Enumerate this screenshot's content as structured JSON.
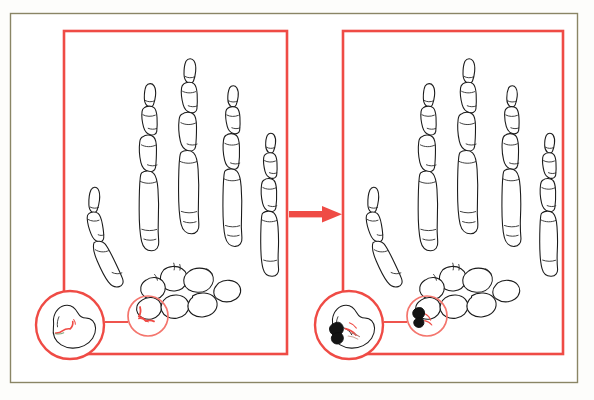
{
  "figure": {
    "title": "Carpal bone fracture before and after surgical fixation",
    "background_color": "#fdfdfb",
    "page_color": "#ffffff"
  },
  "outer_frame": {
    "name": "page-frame",
    "color": "#8a8565",
    "x": 10,
    "y": 13,
    "width": 568,
    "height": 370
  },
  "accent": {
    "red": "#ef4b45",
    "red_light": "#f4756d",
    "bone_outline": "#1b1b1b",
    "hardware_dark": "#141414"
  },
  "panels": [
    {
      "id": "panel-before",
      "label": "Before fixation",
      "border_color": "#ef4b45",
      "x": 64,
      "y": 31,
      "width": 223,
      "height": 323,
      "state": "fractured",
      "inset": {
        "name": "magnified-fracture-inset",
        "center_x": 70,
        "center_y": 325,
        "radius": 35,
        "contents": "carpal bone with red fracture line"
      },
      "highlight_circle": {
        "name": "fracture-highlight-circle",
        "center_x": 148,
        "center_y": 316,
        "radius": 20
      },
      "connector": {
        "from_x": 105,
        "to_x": 128,
        "y": 322
      }
    },
    {
      "id": "panel-after",
      "label": "After fixation",
      "border_color": "#ef4b45",
      "x": 343,
      "y": 31,
      "width": 220,
      "height": 323,
      "state": "fixated",
      "inset": {
        "name": "magnified-fixation-inset",
        "center_x": 349,
        "center_y": 325,
        "radius": 35,
        "contents": "carpal bone with black fixation hardware over healing fracture"
      },
      "highlight_circle": {
        "name": "fixation-highlight-circle",
        "center_x": 427,
        "center_y": 316,
        "radius": 20
      },
      "connector": {
        "from_x": 384,
        "to_x": 407,
        "y": 322
      }
    }
  ],
  "arrow": {
    "name": "progression-arrow",
    "color": "#ef4b45",
    "direction": "right",
    "from_x": 288,
    "to_x": 342,
    "y": 214
  },
  "anatomy": {
    "digits": [
      "thumb",
      "index-finger",
      "middle-finger",
      "ring-finger",
      "little-finger"
    ],
    "bone_groups": [
      "distal-phalanges",
      "middle-phalanges",
      "proximal-phalanges",
      "metacarpals",
      "carpals"
    ],
    "affected_bone": "carpal"
  }
}
